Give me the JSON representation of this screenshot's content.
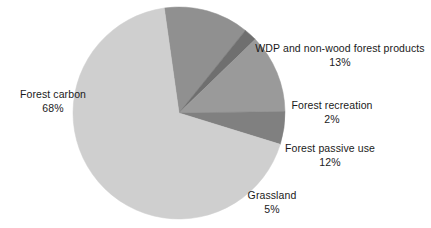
{
  "chart_data": {
    "type": "pie",
    "title": "",
    "categories": [
      "Forest carbon",
      "WDP and non-wood forest products",
      "Forest recreation",
      "Forest passive use",
      "Grassland"
    ],
    "values": [
      68,
      13,
      2,
      12,
      5
    ],
    "value_suffix": "%",
    "legend": "none",
    "labels_position": "outside",
    "start_angle_deg": -8,
    "direction": "clockwise",
    "background": "#ffffff",
    "text_color": "#1a1a1a",
    "slices": [
      {
        "name": "WDP and non-wood forest products",
        "value": 13,
        "percent_label": "13%",
        "color": "#909090",
        "order": 1
      },
      {
        "name": "Forest recreation",
        "value": 2,
        "percent_label": "2%",
        "color": "#6f6f6f",
        "order": 2
      },
      {
        "name": "Forest passive use",
        "value": 12,
        "percent_label": "12%",
        "color": "#9a9a9a",
        "order": 3
      },
      {
        "name": "Grassland",
        "value": 5,
        "percent_label": "5%",
        "color": "#808080",
        "order": 4
      },
      {
        "name": "Forest carbon",
        "value": 68,
        "percent_label": "68%",
        "color": "#cfcfcf",
        "order": 5
      }
    ]
  },
  "labels": {
    "wdp": {
      "name": "WDP and non-wood forest products",
      "percent": "13%"
    },
    "recreation": {
      "name": "Forest recreation",
      "percent": "2%"
    },
    "passive": {
      "name": "Forest passive use",
      "percent": "12%"
    },
    "grassland": {
      "name": "Grassland",
      "percent": "5%"
    },
    "carbon": {
      "name": "Forest carbon",
      "percent": "68%"
    }
  },
  "geometry": {
    "center_x": 179,
    "center_y": 113,
    "radius": 106
  }
}
